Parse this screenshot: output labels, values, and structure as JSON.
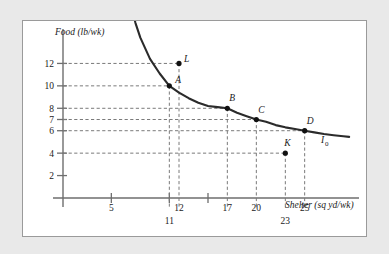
{
  "figure": {
    "background_color": "#e9e9e9",
    "panel_color": "#ffffff",
    "panel_border_color": "#9a9a9a",
    "curve_color": "#2b2b2b",
    "axis_color": "#6e6e6e",
    "dash_color": "#7a7a7a",
    "point_color": "#111111"
  },
  "chart_data": {
    "type": "line",
    "title": "",
    "xlabel": "Shelter (sq yd/wk)",
    "ylabel": "Food (lb/wk)",
    "xlim": [
      0,
      30
    ],
    "ylim": [
      0,
      14
    ],
    "grid": false,
    "legend_position": "curve-end-right",
    "series": [
      {
        "name": "I0",
        "label": "I",
        "label_subscript": "0",
        "description": "indifference curve",
        "x": [
          7.0,
          7.5,
          8,
          9,
          10,
          11,
          12,
          13,
          14,
          15,
          16,
          17,
          18,
          19,
          20,
          21,
          22,
          23,
          24,
          25,
          26,
          27,
          28,
          29,
          29.6
        ],
        "y": [
          17.2,
          15.6,
          14.3,
          12.4,
          11.1,
          10.0,
          9.4,
          8.9,
          8.5,
          8.2,
          8.1,
          8.0,
          7.6,
          7.3,
          7.0,
          6.8,
          6.5,
          6.3,
          6.15,
          6.0,
          5.85,
          5.7,
          5.6,
          5.5,
          5.45
        ]
      }
    ],
    "points": [
      {
        "label": "L",
        "x": 12,
        "y": 12,
        "on_curve": false,
        "label_dx": 5,
        "label_dy": -1
      },
      {
        "label": "A",
        "x": 11,
        "y": 10,
        "on_curve": true,
        "label_dx": 6,
        "label_dy": -3
      },
      {
        "label": "B",
        "x": 17,
        "y": 8,
        "on_curve": true,
        "label_dx": 2,
        "label_dy": -7
      },
      {
        "label": "C",
        "x": 20,
        "y": 7,
        "on_curve": true,
        "label_dx": 2,
        "label_dy": -7
      },
      {
        "label": "D",
        "x": 25,
        "y": 6,
        "on_curve": true,
        "label_dx": 2,
        "label_dy": -7
      },
      {
        "label": "K",
        "x": 23,
        "y": 4,
        "on_curve": false,
        "label_dx": -1,
        "label_dy": -7
      }
    ],
    "yticks": [
      {
        "value": 12,
        "label": "12"
      },
      {
        "value": 10,
        "label": "10"
      },
      {
        "value": 8,
        "label": "8"
      },
      {
        "value": 7,
        "label": "7"
      },
      {
        "value": 6,
        "label": "6"
      },
      {
        "value": 4,
        "label": "4"
      },
      {
        "value": 2,
        "label": "2"
      }
    ],
    "xticks": [
      {
        "value": 5,
        "label": "5",
        "row": "upper",
        "solid_tick": true
      },
      {
        "value": 11,
        "label": "11",
        "row": "lower",
        "solid_tick": true
      },
      {
        "value": 12,
        "label": "12",
        "row": "upper",
        "solid_tick": false
      },
      {
        "value": 15,
        "label": "",
        "row": "upper",
        "solid_tick": true
      },
      {
        "value": 17,
        "label": "17",
        "row": "upper",
        "solid_tick": false
      },
      {
        "value": 20,
        "label": "20",
        "row": "upper",
        "solid_tick": false
      },
      {
        "value": 23,
        "label": "23",
        "row": "lower",
        "solid_tick": false
      },
      {
        "value": 25,
        "label": "25",
        "row": "upper",
        "solid_tick": false
      }
    ],
    "dashed_guides": [
      {
        "point": "L",
        "x": 12,
        "y": 12
      },
      {
        "point": "A",
        "x": 11,
        "y": 10
      },
      {
        "point": "B",
        "x": 17,
        "y": 8
      },
      {
        "point": "C",
        "x": 20,
        "y": 7
      },
      {
        "point": "D",
        "x": 25,
        "y": 6
      },
      {
        "point": "K",
        "x": 23,
        "y": 4
      }
    ]
  }
}
